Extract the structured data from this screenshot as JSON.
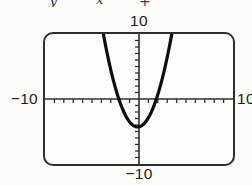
{
  "equation_fragment": {
    "note": "text clipped at top edge of image, only character bottoms visible",
    "pieces": [
      {
        "text": "y"
      },
      {
        "text": "x"
      },
      {
        "text": "+"
      }
    ]
  },
  "chart_data": {
    "type": "line",
    "window": {
      "xmin": -10,
      "xmax": 10,
      "ymin": -10,
      "ymax": 10,
      "xscl": 1,
      "yscl": 1
    },
    "labels": {
      "top": "10",
      "left": "−10",
      "right": "10",
      "bottom": "−10"
    },
    "axes": {
      "color": "#2f2f2f",
      "axis_width": 1.6,
      "tick_width": 1.3,
      "tick_length": 4,
      "ticks_x_direction": "down",
      "ticks_y_direction": "left"
    },
    "series": [
      {
        "name": "parabola",
        "shape": "upward-opening parabola",
        "vertex": [
          -0.2,
          -4.3
        ],
        "x_intercepts": [
          -2.2,
          1.9
        ],
        "model": {
          "a": 1.08,
          "h": -0.15,
          "k": -4.3
        },
        "stroke": "#0d0d0d",
        "stroke_width": 3.2
      }
    ],
    "grid": false,
    "legend": false
  }
}
